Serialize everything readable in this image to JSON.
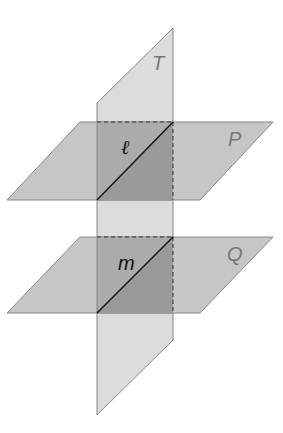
{
  "diagram": {
    "planes": [
      {
        "name": "T",
        "label": "T",
        "orientation": "vertical"
      },
      {
        "name": "P",
        "label": "P",
        "orientation": "horizontal"
      },
      {
        "name": "Q",
        "label": "Q",
        "orientation": "horizontal"
      }
    ],
    "lines": [
      {
        "name": "l",
        "label": "ℓ",
        "intersection_of": [
          "T",
          "P"
        ]
      },
      {
        "name": "m",
        "label": "m",
        "intersection_of": [
          "T",
          "Q"
        ]
      }
    ],
    "colors": {
      "plane_light": "#d9d9d9",
      "plane_mid": "#c4c4c4",
      "overlap": "#a8a8a8",
      "overlap_dark": "#999999",
      "edge": "#888888",
      "line": "#111111"
    }
  }
}
